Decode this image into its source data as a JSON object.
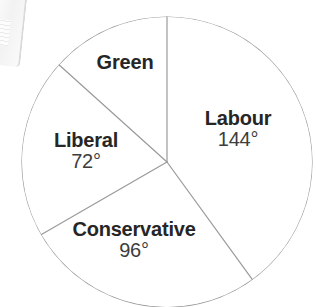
{
  "chart_data": {
    "type": "pie",
    "title": "",
    "subtitle": "",
    "xlabel": "",
    "ylabel": "",
    "legend_position": "none",
    "grid": false,
    "units": "degrees",
    "total_degrees": 360,
    "start_angle_deg": 0,
    "direction": "clockwise",
    "categories": [
      "Labour",
      "Conservative",
      "Liberal",
      "Green"
    ],
    "values": [
      144,
      96,
      72,
      48
    ],
    "slices": [
      {
        "name": "Labour",
        "value_label": "144°",
        "value": 144,
        "start_deg": 0,
        "end_deg": 144,
        "fill": "#ffffff"
      },
      {
        "name": "Conservative",
        "value_label": "96°",
        "value": 96,
        "start_deg": 144,
        "end_deg": 240,
        "fill": "#ffffff"
      },
      {
        "name": "Liberal",
        "value_label": "72°",
        "value": 72,
        "start_deg": 240,
        "end_deg": 312,
        "fill": "#ffffff"
      },
      {
        "name": "Green",
        "value_label": "",
        "value": 48,
        "start_deg": 312,
        "end_deg": 360,
        "fill": "#ffffff"
      }
    ],
    "geometry": {
      "center_x": 167,
      "center_y": 162,
      "radius": 145
    },
    "colors": {
      "background": "#ffffff",
      "stroke": "#9a9a9a",
      "name_text": "#262626",
      "value_text": "#3d3d3d"
    }
  },
  "labels": {
    "green_name": "Green",
    "green_value": "",
    "labour_name": "Labour",
    "labour_value": "144°",
    "liberal_name": "Liberal",
    "liberal_value": "72°",
    "conservative_name": "Conservative",
    "conservative_value": "96°"
  }
}
